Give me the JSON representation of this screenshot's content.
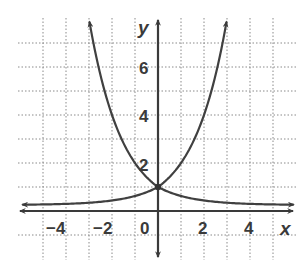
{
  "chart_data": {
    "type": "line",
    "title": "",
    "xlabel": "x",
    "ylabel": "y",
    "xlim": [
      -6,
      6
    ],
    "ylim": [
      -1,
      8
    ],
    "grid": true,
    "x_ticks": [
      -4,
      -2,
      0,
      2,
      4
    ],
    "y_ticks": [
      2,
      4,
      6
    ],
    "x_tick_labels": [
      "−4",
      "−2",
      "0",
      "2",
      "4"
    ],
    "y_tick_labels": [
      "2",
      "4",
      "6"
    ],
    "legend": null,
    "series": [
      {
        "name": "y = 2^x",
        "x": [
          -6,
          -4,
          -3,
          -2,
          -1,
          0,
          1,
          2,
          3
        ],
        "y": [
          0.016,
          0.063,
          0.125,
          0.25,
          0.5,
          1,
          2,
          4,
          8
        ]
      },
      {
        "name": "y = (1/2)^x",
        "x": [
          -3,
          -2,
          -1,
          0,
          1,
          2,
          3,
          4,
          6
        ],
        "y": [
          8,
          4,
          2,
          1,
          0.5,
          0.25,
          0.125,
          0.063,
          0.016
        ]
      }
    ],
    "annotations": [
      {
        "label": "intersection",
        "x": 0,
        "y": 1
      }
    ]
  },
  "labels": {
    "x_axis": "x",
    "y_axis": "y",
    "xt0": "−4",
    "xt1": "−2",
    "xt2": "0",
    "xt3": "2",
    "xt4": "4",
    "yt0": "2",
    "yt1": "4",
    "yt2": "6"
  }
}
